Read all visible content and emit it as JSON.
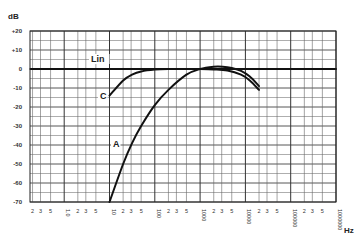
{
  "chart_data": {
    "type": "line",
    "title": "",
    "ylabel": "dB",
    "xlabel": "Hz",
    "xscale": "log",
    "xlim": [
      0.18,
      1000000
    ],
    "ylim": [
      -70,
      20
    ],
    "grid": true,
    "y_ticks": [
      "+20",
      "+10",
      "0",
      "-10",
      "-20",
      "-30",
      "-40",
      "-50",
      "-60",
      "-70"
    ],
    "y_tick_values": [
      20,
      10,
      0,
      -10,
      -20,
      -30,
      -40,
      -50,
      -60,
      -70
    ],
    "x_tick_labels": [
      "2",
      "3",
      "5",
      "1.0",
      "2",
      "3",
      "5",
      "10",
      "2",
      "3",
      "5",
      "100",
      "2",
      "3",
      "5",
      "1000",
      "2",
      "3",
      "5",
      "10000",
      "2",
      "3",
      "5",
      "100000",
      "2",
      "3",
      "5",
      "1000000"
    ],
    "x_tick_values": [
      0.2,
      0.3,
      0.5,
      1,
      2,
      3,
      5,
      10,
      20,
      30,
      50,
      100,
      200,
      300,
      500,
      1000,
      2000,
      3000,
      5000,
      10000,
      20000,
      30000,
      50000,
      100000,
      200000,
      300000,
      500000,
      1000000
    ],
    "series": [
      {
        "name": "Lin",
        "x": [
          0.18,
          1000000
        ],
        "y": [
          0,
          0
        ]
      },
      {
        "name": "C",
        "x": [
          10,
          20,
          31.5,
          50,
          100,
          200,
          500,
          1000,
          2000,
          4000,
          8000,
          12500,
          20000
        ],
        "y": [
          -14,
          -6,
          -3,
          -1.3,
          -0.3,
          0,
          0,
          0,
          -0.2,
          -0.8,
          -3,
          -6,
          -11
        ]
      },
      {
        "name": "A",
        "x": [
          10,
          20,
          31.5,
          50,
          100,
          200,
          500,
          1000,
          2000,
          3150,
          5000,
          8000,
          12500,
          20000
        ],
        "y": [
          -70,
          -50,
          -39,
          -30,
          -19,
          -11,
          -3,
          0,
          1.2,
          1.2,
          0.5,
          -1,
          -4,
          -9
        ]
      }
    ],
    "annotations": [
      {
        "text": "Lin",
        "x": 10,
        "y": 3
      },
      {
        "text": "C",
        "x": 8,
        "y": -17
      },
      {
        "text": "A",
        "x": 12,
        "y": -39
      }
    ]
  }
}
